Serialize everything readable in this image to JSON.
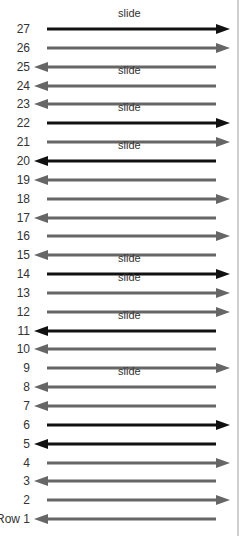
{
  "diagram": {
    "colors": {
      "black": "#111111",
      "gray": "#666666",
      "border": "#cfcfcf"
    },
    "slide_text": "slide",
    "rows": [
      {
        "label": "27",
        "direction": "right",
        "color": "black",
        "slide": true
      },
      {
        "label": "26",
        "direction": "right",
        "color": "gray",
        "slide": false
      },
      {
        "label": "25",
        "direction": "left",
        "color": "gray",
        "slide": false
      },
      {
        "label": "24",
        "direction": "left",
        "color": "gray",
        "slide": true
      },
      {
        "label": "23",
        "direction": "left",
        "color": "gray",
        "slide": false
      },
      {
        "label": "22",
        "direction": "right",
        "color": "black",
        "slide": true
      },
      {
        "label": "21",
        "direction": "right",
        "color": "gray",
        "slide": false
      },
      {
        "label": "20",
        "direction": "left",
        "color": "black",
        "slide": true
      },
      {
        "label": "19",
        "direction": "left",
        "color": "gray",
        "slide": false
      },
      {
        "label": "18",
        "direction": "right",
        "color": "gray",
        "slide": false
      },
      {
        "label": "17",
        "direction": "left",
        "color": "gray",
        "slide": false
      },
      {
        "label": "16",
        "direction": "right",
        "color": "gray",
        "slide": false
      },
      {
        "label": "15",
        "direction": "left",
        "color": "gray",
        "slide": false
      },
      {
        "label": "14",
        "direction": "right",
        "color": "black",
        "slide": true
      },
      {
        "label": "13",
        "direction": "right",
        "color": "gray",
        "slide": true
      },
      {
        "label": "12",
        "direction": "right",
        "color": "gray",
        "slide": false
      },
      {
        "label": "11",
        "direction": "left",
        "color": "black",
        "slide": true
      },
      {
        "label": "10",
        "direction": "left",
        "color": "gray",
        "slide": false
      },
      {
        "label": "9",
        "direction": "right",
        "color": "gray",
        "slide": false
      },
      {
        "label": "8",
        "direction": "left",
        "color": "gray",
        "slide": true
      },
      {
        "label": "7",
        "direction": "left",
        "color": "gray",
        "slide": false
      },
      {
        "label": "6",
        "direction": "right",
        "color": "black",
        "slide": false
      },
      {
        "label": "5",
        "direction": "left",
        "color": "black",
        "slide": false
      },
      {
        "label": "4",
        "direction": "right",
        "color": "gray",
        "slide": false
      },
      {
        "label": "3",
        "direction": "left",
        "color": "gray",
        "slide": false
      },
      {
        "label": "2",
        "direction": "right",
        "color": "gray",
        "slide": false
      },
      {
        "label": "Row 1",
        "direction": "left",
        "color": "gray",
        "slide": false
      }
    ]
  }
}
